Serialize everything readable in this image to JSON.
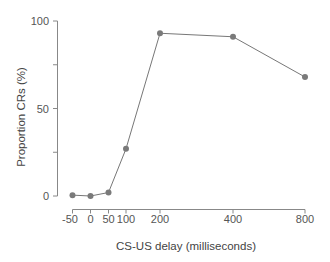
{
  "chart_data": {
    "type": "line",
    "title": "",
    "xlabel": "CS-US delay (milliseconds)",
    "ylabel": "Proportion CRs (%)",
    "x_tick_labels": [
      "-50",
      "0",
      "50",
      "100",
      "200",
      "400",
      "800"
    ],
    "x_tick_positions_px": [
      72.5,
      90.5,
      108.5,
      126,
      160,
      233,
      305
    ],
    "y_ticks_major": [
      0,
      50,
      100
    ],
    "y_ticks_minor": [
      25,
      75
    ],
    "ylim": [
      0,
      100
    ],
    "grid": false,
    "legend": null,
    "series": [
      {
        "name": "Proportion CRs",
        "x": [
          -50,
          0,
          50,
          100,
          200,
          400,
          800
        ],
        "values": [
          0.5,
          0,
          2,
          27,
          93,
          91,
          68
        ],
        "color": "#777777",
        "marker": "circle"
      }
    ]
  },
  "axes": {
    "y": {
      "labels": [
        "0",
        "50",
        "100"
      ]
    },
    "x": {
      "labels": [
        "-50",
        "0",
        "50",
        "100",
        "200",
        "400",
        "800"
      ]
    }
  },
  "colors": {
    "axis": "#888888",
    "line": "#777777",
    "marker": "#7a7a7a",
    "text": "#555555"
  }
}
